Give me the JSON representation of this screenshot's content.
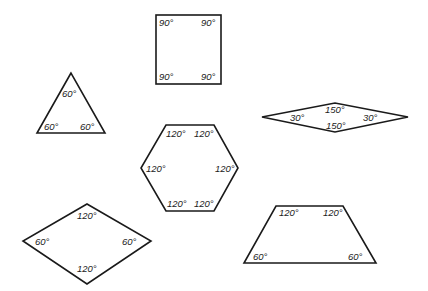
{
  "figure": {
    "stroke_color": "#1a1a1a",
    "background": "#ffffff"
  },
  "shapes": {
    "square": {
      "name": "Square",
      "angles": [
        "90°",
        "90°",
        "90°",
        "90°"
      ]
    },
    "triangle": {
      "name": "Equilateral triangle",
      "angles": [
        "60°",
        "60°",
        "60°"
      ]
    },
    "thin_rhombus": {
      "name": "Rhombus (30°/150°)",
      "angles": [
        "30°",
        "150°",
        "150°",
        "30°"
      ]
    },
    "hexagon": {
      "name": "Regular hexagon",
      "angles": [
        "120°",
        "120°",
        "120°",
        "120°",
        "120°",
        "120°"
      ]
    },
    "diamond": {
      "name": "Rhombus (60°/120°)",
      "angles": [
        "120°",
        "60°",
        "60°",
        "120°"
      ]
    },
    "trapezoid": {
      "name": "Isosceles trapezoid",
      "angles": [
        "120°",
        "120°",
        "60°",
        "60°"
      ]
    }
  }
}
